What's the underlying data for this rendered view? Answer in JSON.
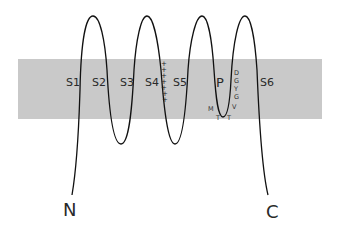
{
  "diagram": {
    "type": "ion-channel-membrane-topology",
    "membrane": {
      "x": 18,
      "y": 59,
      "width": 304,
      "height": 60,
      "color": "#c9c9c9"
    },
    "segments": [
      {
        "id": "S1",
        "label": "S1",
        "x": 70,
        "y": 86
      },
      {
        "id": "S2",
        "label": "S2",
        "x": 100,
        "y": 86
      },
      {
        "id": "S3",
        "label": "S3",
        "x": 127,
        "y": 86
      },
      {
        "id": "S4",
        "label": "S4",
        "x": 153,
        "y": 86
      },
      {
        "id": "S5",
        "label": "S5",
        "x": 181,
        "y": 86
      },
      {
        "id": "P",
        "label": "P",
        "x": 222,
        "y": 86
      },
      {
        "id": "S6",
        "label": "S6",
        "x": 268,
        "y": 86
      }
    ],
    "s4_charges": {
      "symbol": "+",
      "count": 7
    },
    "selectivity_filter": {
      "right_column": [
        "D",
        "G",
        "Y",
        "G",
        "V"
      ],
      "bottom": [
        "M",
        "T",
        "T"
      ]
    },
    "termini": {
      "n": "N",
      "c": "C"
    },
    "line_color": "#111111"
  }
}
